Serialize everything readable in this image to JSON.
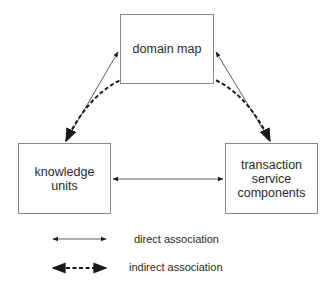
{
  "diagram": {
    "nodes": [
      {
        "id": "domain-map",
        "label": "domain map"
      },
      {
        "id": "knowledge-units",
        "label": "knowledge\nunits"
      },
      {
        "id": "transaction-service-components",
        "label": "transaction\nservice\ncomponents"
      }
    ],
    "edges": [
      {
        "from": "domain-map",
        "to": "knowledge-units",
        "type": "direct",
        "bidirectional": true
      },
      {
        "from": "domain-map",
        "to": "transaction-service-components",
        "type": "direct",
        "bidirectional": true
      },
      {
        "from": "knowledge-units",
        "to": "transaction-service-components",
        "type": "direct",
        "bidirectional": true
      },
      {
        "from": "knowledge-units",
        "to": "transaction-service-components",
        "type": "indirect",
        "bidirectional": true,
        "via": "domain-map"
      }
    ],
    "legend": {
      "direct": "direct association",
      "indirect": "indirect association"
    },
    "colors": {
      "stroke": "#1a1a1a",
      "box_border": "#8a8a8a",
      "text": "#2a2a2a"
    }
  }
}
